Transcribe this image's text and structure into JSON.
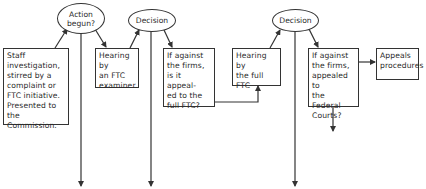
{
  "diagram": {
    "type": "flowchart",
    "nodes": {
      "action_begun": {
        "shape": "ellipse",
        "lines": [
          "Action",
          "begun?"
        ]
      },
      "decision_1": {
        "shape": "ellipse",
        "lines": [
          "Decision"
        ]
      },
      "decision_2": {
        "shape": "ellipse",
        "lines": [
          "Decision"
        ]
      },
      "staff_investigation": {
        "shape": "box",
        "lines": [
          "Staff",
          "investigation,",
          "stirred by a",
          "complaint or",
          "FTC initiative.",
          "Presented to the",
          "Commission."
        ]
      },
      "hearing_examiner": {
        "shape": "box",
        "lines": [
          "Hearing by",
          "an FTC",
          "examiner."
        ]
      },
      "appeal_full_ftc": {
        "shape": "box",
        "lines": [
          "If against",
          "the firms,",
          "is it appeal-",
          "ed to the",
          "full FTC?"
        ]
      },
      "hearing_full_ftc": {
        "shape": "box",
        "lines": [
          "Hearing by",
          "the full",
          "FTC"
        ]
      },
      "appeal_federal_courts": {
        "shape": "box",
        "lines": [
          "If against",
          "the firms,",
          "appealed to",
          "the Federal",
          "Courts?"
        ]
      },
      "appeals_procedures": {
        "shape": "box",
        "lines": [
          "Appeals",
          "procedures"
        ]
      }
    },
    "edges": [
      {
        "from": "staff_investigation",
        "to": "action_begun"
      },
      {
        "from": "action_begun",
        "to": "hearing_examiner"
      },
      {
        "from": "action_begun",
        "to": "down",
        "label": ""
      },
      {
        "from": "hearing_examiner",
        "to": "decision_1"
      },
      {
        "from": "decision_1",
        "to": "appeal_full_ftc"
      },
      {
        "from": "decision_1",
        "to": "down",
        "label": ""
      },
      {
        "from": "appeal_full_ftc",
        "to": "hearing_full_ftc"
      },
      {
        "from": "hearing_full_ftc",
        "to": "decision_2"
      },
      {
        "from": "decision_2",
        "to": "appeal_federal_courts"
      },
      {
        "from": "decision_2",
        "to": "down",
        "label": ""
      },
      {
        "from": "appeal_federal_courts",
        "to": "appeals_procedures"
      },
      {
        "from": "appeal_federal_courts",
        "to": "down",
        "label": ""
      }
    ],
    "colors": {
      "line": "#333333",
      "background": "#ffffff",
      "text": "#2a2a2a"
    }
  }
}
